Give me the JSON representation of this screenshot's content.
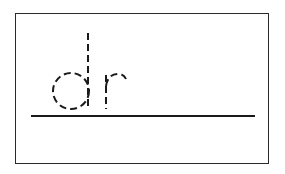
{
  "worksheet": {
    "trace_text": "dr",
    "letters": [
      {
        "char": "d",
        "style": "dashed-outline"
      },
      {
        "char": "r",
        "style": "dashed-outline"
      }
    ],
    "colors": {
      "border": "#2a2a2a",
      "stroke": "#1a1a1a",
      "background": "#ffffff"
    }
  }
}
